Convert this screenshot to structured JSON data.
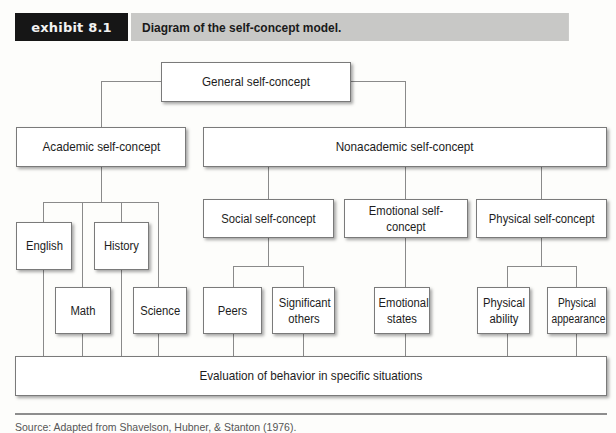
{
  "header": {
    "exhibit_label": "exhibit 8.1",
    "title": "Diagram of the self-concept model."
  },
  "nodes": {
    "general": "General self-concept",
    "academic": "Academic self-concept",
    "nonacademic": "Nonacademic self-concept",
    "english": "English",
    "history": "History",
    "math": "Math",
    "science": "Science",
    "social": "Social self-concept",
    "emotional": "Emotional self-concept",
    "physical": "Physical self-concept",
    "peers": "Peers",
    "significant_others": "Significant others",
    "emotional_states": "Emotional states",
    "physical_ability": "Physical ability",
    "physical_appearance": "Physical appearance",
    "evaluation": "Evaluation of behavior in specific situations"
  },
  "footer": {
    "source": "Source: Adapted from Shavelson, Hubner, & Stanton (1976)."
  },
  "colors": {
    "tag_bg": "#161616",
    "title_bg": "#c8c8c6",
    "line": "#8a8a8a",
    "node_border": "#7a7a7a"
  }
}
